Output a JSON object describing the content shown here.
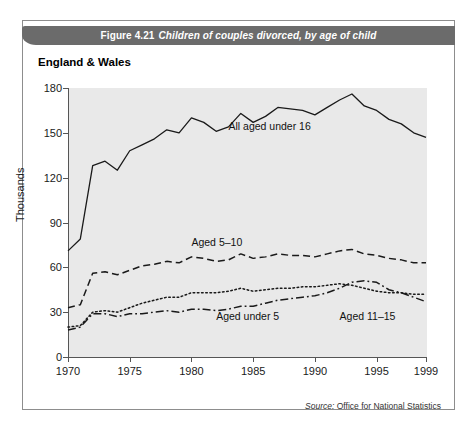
{
  "figure": {
    "number": "Figure 4.21",
    "caption": "Children of couples divorced, by age of child",
    "region_label": "England & Wales",
    "source_word": "Source:",
    "source_text": " Office for National Statistics",
    "title_bar_color": "#6b6b6b",
    "plot_background_color": "#e9e9e9",
    "line_color": "#1a1a1a"
  },
  "chart_data": {
    "type": "line",
    "subtitle": "England & Wales",
    "xlabel": "",
    "ylabel": "Thousands",
    "xlim": [
      1970,
      1999
    ],
    "ylim": [
      0,
      180
    ],
    "yticks": [
      0,
      30,
      60,
      90,
      120,
      150,
      180
    ],
    "xticks": [
      1970,
      1975,
      1980,
      1985,
      1990,
      1995,
      1999
    ],
    "grid": false,
    "legend_position": "inline-annotations",
    "x": [
      1970,
      1971,
      1972,
      1973,
      1974,
      1975,
      1976,
      1977,
      1978,
      1979,
      1980,
      1981,
      1982,
      1983,
      1984,
      1985,
      1986,
      1987,
      1988,
      1989,
      1990,
      1991,
      1992,
      1993,
      1994,
      1995,
      1996,
      1997,
      1998,
      1999
    ],
    "series": [
      {
        "name": "All aged under 16",
        "style": "solid",
        "label_text": "All aged under 16",
        "values": [
          71,
          79,
          128,
          131,
          125,
          138,
          142,
          146,
          152,
          150,
          160,
          157,
          151,
          154,
          163,
          157,
          161,
          167,
          166,
          165,
          162,
          167,
          172,
          176,
          168,
          165,
          159,
          156,
          150,
          147
        ]
      },
      {
        "name": "Aged 5-10",
        "style": "dashed",
        "label_text": "Aged 5–10",
        "values": [
          33,
          35,
          56,
          57,
          55,
          58,
          61,
          62,
          64,
          63,
          67,
          66,
          64,
          65,
          69,
          66,
          67,
          69,
          68,
          68,
          67,
          69,
          71,
          72,
          69,
          68,
          66,
          65,
          63,
          63
        ]
      },
      {
        "name": "Aged 11-15",
        "style": "dotted",
        "label_text": "Aged 11–15",
        "values": [
          20,
          21,
          30,
          31,
          30,
          33,
          36,
          38,
          40,
          40,
          43,
          43,
          43,
          44,
          46,
          44,
          45,
          46,
          46,
          47,
          47,
          48,
          49,
          48,
          46,
          44,
          43,
          43,
          42,
          42
        ]
      },
      {
        "name": "Aged under 5",
        "style": "dashdot",
        "label_text": "Aged under 5",
        "values": [
          18,
          20,
          29,
          29,
          27,
          29,
          29,
          30,
          31,
          30,
          32,
          32,
          31,
          32,
          34,
          34,
          36,
          38,
          39,
          40,
          41,
          43,
          46,
          50,
          51,
          50,
          45,
          43,
          40,
          37
        ]
      }
    ],
    "annotations": [
      {
        "text": "All aged under 16",
        "x": 1983,
        "y": 154
      },
      {
        "text": "Aged 5–10",
        "x": 1980,
        "y": 76
      },
      {
        "text": "Aged under 5",
        "x": 1982,
        "y": 27
      },
      {
        "text": "Aged 11–15",
        "x": 1992,
        "y": 27
      }
    ]
  }
}
